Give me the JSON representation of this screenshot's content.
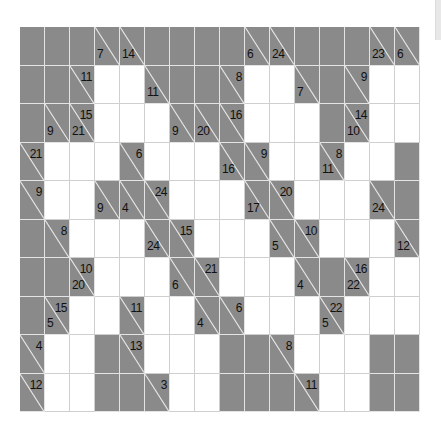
{
  "puzzle": {
    "type": "kakuro",
    "rows": 10,
    "cols": 16,
    "colors": {
      "block": "#8a8a8a",
      "white": "#ffffff",
      "grid_line": "#e4e4e4",
      "text": "#111111"
    },
    "legend": "B = black block, W = empty white entry cell, {d,r} = clue cell with down/right sums",
    "grid": [
      [
        "B",
        "B",
        "B",
        {
          "d": 7
        },
        {
          "d": 14
        },
        "B",
        "B",
        "B",
        "B",
        {
          "d": 6
        },
        {
          "d": 24
        },
        "B",
        "B",
        "B",
        {
          "d": 23
        },
        {
          "d": 6
        }
      ],
      [
        "B",
        "B",
        {
          "r": 11
        },
        "W",
        "W",
        {
          "d": 11
        },
        "B",
        "B",
        {
          "r": 8
        },
        "W",
        "W",
        {
          "d": 7
        },
        "B",
        {
          "r": 9
        },
        "W",
        "W"
      ],
      [
        "B",
        {
          "d": 9
        },
        {
          "d": 21,
          "r": 15
        },
        "W",
        "W",
        "W",
        {
          "d": 9
        },
        {
          "d": 20
        },
        {
          "r": 16
        },
        "W",
        "W",
        "W",
        "B",
        {
          "d": 10,
          "r": 14
        },
        "W",
        "W"
      ],
      [
        {
          "r": 21
        },
        "W",
        "W",
        "W",
        {
          "r": 6
        },
        "W",
        "W",
        "W",
        {
          "d": 16
        },
        {
          "r": 9
        },
        "W",
        "W",
        {
          "d": 11,
          "r": 8
        },
        "W",
        "W",
        "B"
      ],
      [
        {
          "r": 9
        },
        "W",
        "W",
        {
          "d": 9
        },
        {
          "d": 4
        },
        {
          "r": 24
        },
        "W",
        "W",
        "W",
        {
          "d": 17
        },
        {
          "r": 20
        },
        "W",
        "W",
        "W",
        {
          "d": 24
        },
        "B"
      ],
      [
        "B",
        {
          "r": 8
        },
        "W",
        "W",
        "W",
        {
          "d": 24
        },
        {
          "r": 15
        },
        "W",
        "W",
        "W",
        {
          "d": 5
        },
        {
          "r": 10
        },
        "W",
        "W",
        "W",
        {
          "d": 12
        }
      ],
      [
        "B",
        "B",
        {
          "d": 20,
          "r": 10
        },
        "W",
        "W",
        "W",
        {
          "d": 6
        },
        {
          "r": 21
        },
        "W",
        "W",
        "W",
        {
          "d": 4
        },
        "B",
        {
          "d": 22,
          "r": 16
        },
        "W",
        "W"
      ],
      [
        "B",
        {
          "d": 5,
          "r": 15
        },
        "W",
        "W",
        {
          "r": 11
        },
        "W",
        "W",
        {
          "d": 4
        },
        {
          "r": 6
        },
        "W",
        "W",
        "W",
        {
          "d": 5,
          "r": 22
        },
        "W",
        "W",
        "W"
      ],
      [
        {
          "r": 4
        },
        "W",
        "W",
        "B",
        {
          "r": 13
        },
        "W",
        "W",
        "W",
        "B",
        "B",
        {
          "r": 8
        },
        "W",
        "W",
        "W",
        "B",
        "B"
      ],
      [
        {
          "r": 12
        },
        "W",
        "W",
        "B",
        "B",
        {
          "r": 3
        },
        "W",
        "W",
        "B",
        "B",
        "B",
        {
          "r": 11
        },
        "W",
        "W",
        "B",
        "B"
      ]
    ]
  }
}
